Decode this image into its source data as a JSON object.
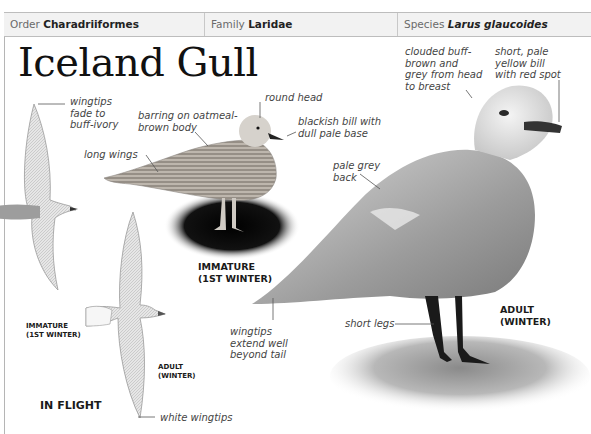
{
  "header": {
    "order_label": "Order",
    "order_value": "Charadriiformes",
    "family_label": "Family",
    "family_value": "Laridae",
    "species_label": "Species",
    "species_value": "Larus glaucoides"
  },
  "title": "Iceland Gull",
  "annotations": {
    "wingtips_fade": "wingtips\nfade to\nbuff-ivory",
    "barring": "barring on oatmeal-\nbrown body",
    "round_head": "round head",
    "blackish_bill": "blackish bill with\ndull pale base",
    "long_wings": "long wings",
    "clouded": "clouded buff-\nbrown and\ngrey from head\nto breast",
    "short_bill": "short, pale\nyellow bill\nwith red spot",
    "pale_grey_back": "pale grey\nback",
    "wingtips_extend": "wingtips\nextend well\nbeyond tail",
    "short_legs": "short legs",
    "white_wingtips": "white wingtips"
  },
  "captions": {
    "immature_standing": "IMMATURE\n(1ST WINTER)",
    "adult_standing": "ADULT\n(WINTER)",
    "immature_flight": "IMMATURE\n(1ST WINTER)",
    "adult_flight": "ADULT\n(WINTER)",
    "in_flight": "IN FLIGHT"
  }
}
